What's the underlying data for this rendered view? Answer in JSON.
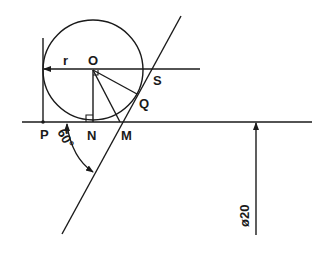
{
  "diagram": {
    "labels": {
      "O": "O",
      "r": "r",
      "S": "S",
      "Q": "Q",
      "P": "P",
      "N": "N",
      "M": "M",
      "angle": "60°",
      "diameter": "ø20"
    },
    "colors": {
      "ink": "#1a1a1a",
      "background": "#ffffff"
    }
  }
}
